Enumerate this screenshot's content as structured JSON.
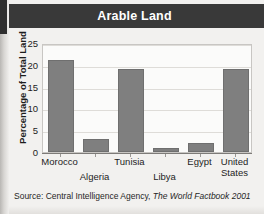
{
  "figure": {
    "title": "Arable Land",
    "source_prefix": "Source: Central Intelligence Agency,",
    "source_work": "The World Factbook 2001",
    "title_bar_color": "#393939",
    "bar_color": "#7f7f7f",
    "plot_background": "#fbfbfa",
    "page_background": "#f2f1ef"
  },
  "chart_data": {
    "type": "bar",
    "title": "Arable Land",
    "xlabel": "",
    "ylabel": "Percentage of Total Land",
    "categories": [
      "Morocco",
      "Algeria",
      "Tunisia",
      "Libya",
      "Egypt",
      "United States"
    ],
    "values": [
      21,
      3,
      19,
      1,
      2,
      19
    ],
    "ylim": [
      0,
      25
    ],
    "yticks": [
      0,
      5,
      10,
      15,
      20,
      25
    ],
    "ytick_labels": [
      "0",
      "5",
      "10",
      "15",
      "20",
      "25"
    ],
    "grid": true,
    "legend": "none",
    "label_rows": [
      0,
      1,
      0,
      1,
      0,
      0
    ],
    "category_label_lines": [
      [
        "Morocco"
      ],
      [
        "Algeria"
      ],
      [
        "Tunisia"
      ],
      [
        "Libya"
      ],
      [
        "Egypt"
      ],
      [
        "United",
        "States"
      ]
    ]
  }
}
